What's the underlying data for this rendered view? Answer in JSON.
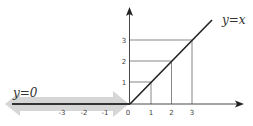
{
  "diagram": {
    "labels": {
      "positive_branch": "y=x",
      "negative_branch": "y=0"
    },
    "x_ticks": [
      {
        "label": "-3",
        "value": -3
      },
      {
        "label": "-2",
        "value": -2
      },
      {
        "label": "-1",
        "value": -1
      },
      {
        "label": "0",
        "value": 0
      },
      {
        "label": "1",
        "value": 1
      },
      {
        "label": "2",
        "value": 2
      },
      {
        "label": "3",
        "value": 3
      }
    ],
    "y_ticks": [
      {
        "label": "1",
        "value": 1
      },
      {
        "label": "2",
        "value": 2
      },
      {
        "label": "3",
        "value": 3
      }
    ],
    "colors": {
      "axis": "#333333",
      "function_line": "#222222",
      "guide_lines": "#555555",
      "highlight_band": "#cccccc"
    }
  }
}
